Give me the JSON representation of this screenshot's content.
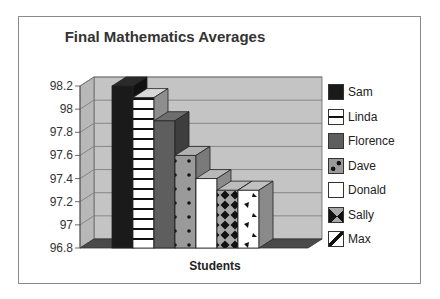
{
  "chart_data": {
    "type": "bar",
    "title": "Final Mathematics Averages",
    "xlabel": "Students",
    "ylabel": "",
    "ylim": [
      96.8,
      98.2
    ],
    "yticks": [
      "98.2",
      "98",
      "97.8",
      "97.6",
      "97.4",
      "97.2",
      "97",
      "96.8"
    ],
    "grid": true,
    "legend_position": "right",
    "style": "3d",
    "categories": [
      "Sam",
      "Linda",
      "Florence",
      "Dave",
      "Donald",
      "Sally",
      "Max"
    ],
    "values": [
      98.2,
      98.1,
      97.9,
      97.6,
      97.4,
      97.3,
      97.3
    ],
    "series": [
      {
        "name": "Sam",
        "value": 98.2,
        "pattern": "solid-black"
      },
      {
        "name": "Linda",
        "value": 98.1,
        "pattern": "horizontal-stripes"
      },
      {
        "name": "Florence",
        "value": 97.9,
        "pattern": "solid-dark-gray"
      },
      {
        "name": "Dave",
        "value": 97.6,
        "pattern": "gray-dots"
      },
      {
        "name": "Donald",
        "value": 97.4,
        "pattern": "solid-white"
      },
      {
        "name": "Sally",
        "value": 97.3,
        "pattern": "diamond-checker"
      },
      {
        "name": "Max",
        "value": 97.3,
        "pattern": "white-triangles"
      }
    ]
  },
  "colors": {
    "wall": "#c4c4c4",
    "side_wall": "#b8b8b8",
    "floor": "#4a4a4a",
    "frame": "#8a8a8a"
  }
}
